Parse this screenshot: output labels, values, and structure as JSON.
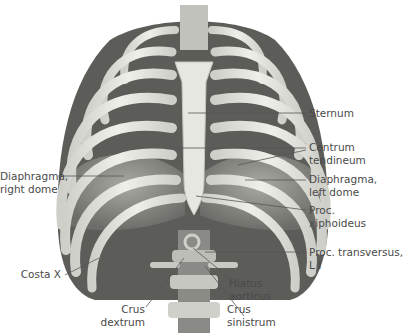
{
  "figure": {
    "labels": [
      {
        "id": "sternum",
        "lines": [
          "Sternum"
        ]
      },
      {
        "id": "centrum-tendineum",
        "lines": [
          "Centrum",
          "tendineum"
        ]
      },
      {
        "id": "diaphragma-left-dome",
        "lines": [
          "Diaphragma,",
          "left dome"
        ]
      },
      {
        "id": "proc-xiphoideus",
        "lines": [
          "Proc.",
          "xiphoideus"
        ]
      },
      {
        "id": "proc-transversus",
        "lines": [
          "Proc. transversus,",
          "L I"
        ]
      },
      {
        "id": "hiatus-aorticus",
        "lines": [
          "Hiatus",
          "aorticus"
        ]
      },
      {
        "id": "crus-sinistrum",
        "lines": [
          "Crus",
          "sinistrum"
        ]
      },
      {
        "id": "crus-dextrum",
        "lines": [
          "Crus",
          "dextrum"
        ]
      },
      {
        "id": "costa-x",
        "lines": [
          "Costa X"
        ]
      },
      {
        "id": "diaphragma-right-dome",
        "lines": [
          "Diaphragma,",
          "right dome"
        ]
      }
    ]
  },
  "colors": {
    "bone": "#e4e4df",
    "bone_shadow": "#b9b9b3",
    "muscle": "#6e6e6b",
    "muscle_dark": "#4d4d4a",
    "leader_line": "#555555",
    "text": "#4a4a4a"
  }
}
